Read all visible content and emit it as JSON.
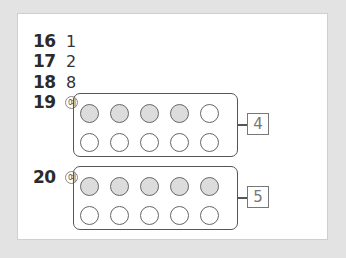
{
  "problems": [
    {
      "number": "16",
      "answer": "1"
    },
    {
      "number": "17",
      "answer": "2"
    },
    {
      "number": "18",
      "answer": "8"
    },
    {
      "number": "19",
      "example_mark": "예",
      "ten_frame": {
        "filled": 4,
        "total": 10
      },
      "answer": "4"
    },
    {
      "number": "20",
      "example_mark": "예",
      "ten_frame": {
        "filled": 5,
        "total": 10
      },
      "answer": "5"
    }
  ],
  "colors": {
    "filled_circle": "#dcdcdc",
    "empty_circle": "#ffffff",
    "background": "#e3e3e3",
    "card": "#ffffff"
  }
}
